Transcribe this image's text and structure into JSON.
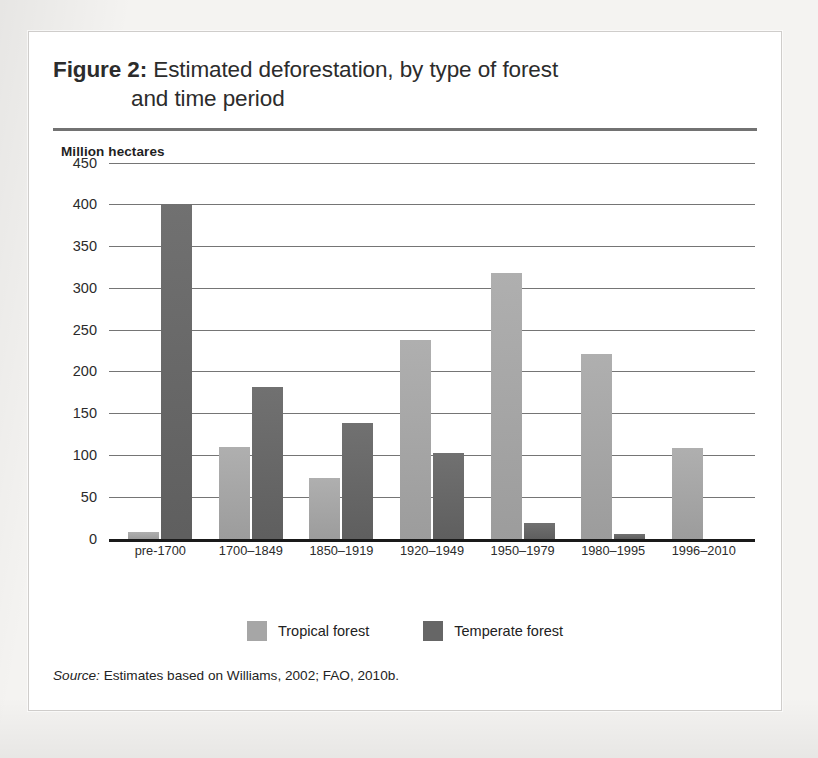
{
  "figure": {
    "label": "Figure 2:",
    "title_line1": "Estimated deforestation, by type of forest",
    "title_line2": "and time period",
    "source_keyword": "Source:",
    "source_text": "Estimates based on Williams, 2002; FAO, 2010b."
  },
  "colors": {
    "tropical": "#a6a6a6",
    "temperate": "#666666",
    "gridline": "#5d5d5d",
    "baseline": "#1a1a1a",
    "page_background": "#f4f3f1",
    "card_background": "#ffffff"
  },
  "chart_data": {
    "type": "bar",
    "title": "Figure 2: Estimated deforestation, by type of forest and time period",
    "xlabel": "",
    "ylabel": "Million hectares",
    "ylim": [
      0,
      450
    ],
    "yticks": [
      450,
      400,
      350,
      300,
      250,
      200,
      150,
      100,
      50,
      0
    ],
    "grid": true,
    "legend_position": "bottom",
    "categories": [
      "pre-1700",
      "1700–1849",
      "1850–1919",
      "1920–1949",
      "1950–1979",
      "1980–1995",
      "1996–2010"
    ],
    "series": [
      {
        "name": "Tropical forest",
        "color": "#a6a6a6",
        "values": [
          8,
          110,
          72,
          238,
          318,
          221,
          108
        ]
      },
      {
        "name": "Temperate forest",
        "color": "#666666",
        "values": [
          400,
          181,
          138,
          102,
          19,
          6,
          0
        ]
      }
    ]
  }
}
